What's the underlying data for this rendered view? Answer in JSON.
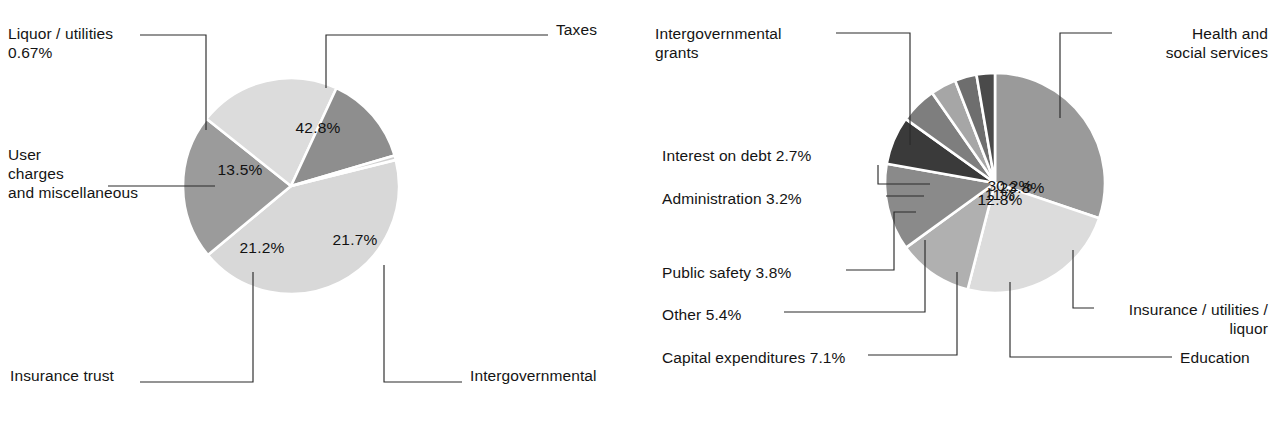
{
  "page": {
    "width": 1273,
    "height": 422,
    "background": "#ffffff"
  },
  "chart_data": [
    {
      "type": "pie",
      "name": "state-revenue-pie",
      "title": "",
      "center": [
        291,
        186
      ],
      "radius": 108,
      "start_angle_deg": -14,
      "categories": [
        "Taxes",
        "Intergovernmental",
        "Insurance trust",
        "User charges and miscellaneous",
        "Liquor / utilities"
      ],
      "values": [
        42.8,
        21.7,
        21.2,
        13.5,
        0.67
      ],
      "value_labels": [
        "42.8%",
        "21.7%",
        "21.2%",
        "13.5%",
        ""
      ],
      "colors": [
        "#d8d8d8",
        "#9b9b9b",
        "#dcdcdc",
        "#8e8e8e",
        "#cfcfcf"
      ],
      "explode": [
        0,
        0,
        0,
        0,
        0
      ],
      "legend": "callout-leaders",
      "grid": false,
      "slice_value_positions": [
        [
          318,
          128
        ],
        [
          355,
          240
        ],
        [
          262,
          248
        ],
        [
          240,
          170
        ],
        null
      ],
      "callouts": [
        {
          "key": "taxes",
          "text": "Taxes",
          "align": "left",
          "x": 556,
          "y": 20,
          "w": 80,
          "leader": "M 326,88 L 326,35 L 548,35"
        },
        {
          "key": "liquor-utilities",
          "text": "Liquor / utilities\n0.67%",
          "align": "left",
          "x": 8,
          "y": 24,
          "w": 150,
          "leader": "M 206,130 L 206,35 L 140,35"
        },
        {
          "key": "user-charges",
          "text": "User\ncharges\nand miscellaneous",
          "align": "left",
          "x": 8,
          "y": 145,
          "w": 180,
          "leader": "M 215,186 L 108,186"
        },
        {
          "key": "insurance-trust",
          "text": "Insurance trust",
          "align": "left",
          "x": 10,
          "y": 366,
          "w": 130,
          "leader": "M 253,272 L 253,382 L 140,382"
        },
        {
          "key": "intergovernmental",
          "text": "Intergovernmental",
          "align": "left",
          "x": 470,
          "y": 366,
          "w": 170,
          "leader": "M 384,265 L 384,382 L 462,382"
        }
      ]
    },
    {
      "type": "pie",
      "name": "state-expenditure-pie",
      "title": "",
      "center": [
        995,
        183
      ],
      "radius": 110,
      "start_angle_deg": -90,
      "categories": [
        "Intergovernmental grants",
        "Health and social services",
        "Insurance / utilities / liquor",
        "Education",
        "Capital expenditures",
        "Other",
        "Public safety",
        "Administration",
        "Interest on debt"
      ],
      "values": [
        30.2,
        23.8,
        11,
        12.8,
        7.1,
        5.4,
        3.8,
        3.2,
        2.7
      ],
      "value_labels": [
        "30.2%",
        "23.8%",
        "11%",
        "12.8%",
        "",
        "",
        "",
        "",
        ""
      ],
      "colors": [
        "#9a9a9a",
        "#dcdcdc",
        "#b0b0b0",
        "#8a8a8a",
        "#3a3a3a",
        "#7e7e7e",
        "#a6a6a6",
        "#6e6e6e",
        "#4a4a4a"
      ],
      "legend": "callout-leaders",
      "grid": false,
      "slice_value_positions": [
        [
          1010,
          186
        ],
        [
          1022,
          188
        ],
        [
          1000,
          195
        ],
        [
          1000,
          200
        ],
        null,
        null,
        null,
        null,
        null
      ],
      "callouts": [
        {
          "key": "intergovernmental-grants",
          "text": "Intergovernmental\ngrants",
          "align": "left",
          "x": 655,
          "y": 24,
          "w": 170,
          "leader": "M 910,145 L 910,33 L 836,33"
        },
        {
          "key": "health-and-social-services",
          "text": "Health and\nsocial services",
          "align": "right",
          "x": 1120,
          "y": 24,
          "w": 148,
          "leader": "M 1060,118 L 1060,33 L 1112,33"
        },
        {
          "key": "interest-on-debt",
          "text": "Interest on debt 2.7%",
          "align": "left",
          "x": 662,
          "y": 146,
          "w": 200,
          "leader": "M 930,184 L 878,184 L 878,165"
        },
        {
          "key": "administration",
          "text": "Administration 3.2%",
          "align": "left",
          "x": 662,
          "y": 189,
          "w": 200,
          "leader": "M 924,196 L 886,196"
        },
        {
          "key": "public-safety",
          "text": "Public safety 3.8%",
          "align": "left",
          "x": 662,
          "y": 263,
          "w": 200,
          "leader": "M 916,212 L 894,212 L 894,270 L 846,270"
        },
        {
          "key": "other",
          "text": "Other 5.4%",
          "align": "left",
          "x": 662,
          "y": 305,
          "w": 200,
          "leader": "M 925,240 L 925,312 L 784,312"
        },
        {
          "key": "capital-expenditures",
          "text": "Capital expenditures 7.1%",
          "align": "left",
          "x": 662,
          "y": 348,
          "w": 230,
          "leader": "M 957,272 L 957,355 L 868,355"
        },
        {
          "key": "education",
          "text": "Education",
          "align": "left",
          "x": 1180,
          "y": 348,
          "w": 90,
          "leader": "M 1010,282 L 1010,357 L 1172,357"
        },
        {
          "key": "insurance-utilities-liquor",
          "text": "Insurance / utilities /\nliquor",
          "align": "right",
          "x": 1100,
          "y": 300,
          "w": 168,
          "leader": "M 1073,250 L 1073,308 L 1094,308"
        }
      ]
    }
  ]
}
